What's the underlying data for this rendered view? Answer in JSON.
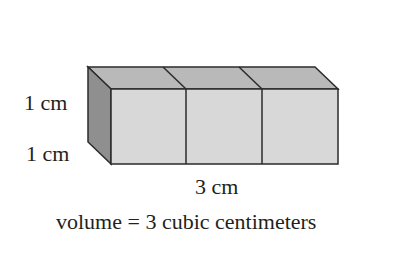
{
  "labels": {
    "height": "1 cm",
    "depth": "1 cm",
    "length": "3 cm",
    "volume": "volume = 3 cubic centimeters"
  },
  "figure": {
    "cube_count": 3,
    "colors": {
      "front": "#d6d6d6",
      "top": "#b8b8b8",
      "side": "#8f8f8f",
      "stroke": "#2b2b2b"
    }
  }
}
